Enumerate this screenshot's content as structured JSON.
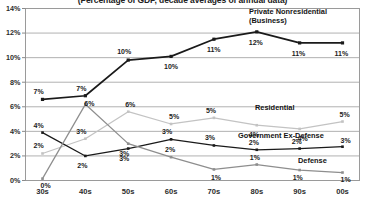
{
  "chart_data": {
    "type": "line",
    "title": "(Percentage of GDP, decade averages of annual data)",
    "xlabel": "",
    "ylabel": "",
    "categories": [
      "30s",
      "40s",
      "50s",
      "60s",
      "70s",
      "80s",
      "90s",
      "00s"
    ],
    "ylim": [
      0,
      14
    ],
    "ytick_labels": [
      "0%",
      "2%",
      "4%",
      "6%",
      "8%",
      "10%",
      "12%",
      "14%"
    ],
    "ytick_values": [
      0,
      2,
      4,
      6,
      8,
      10,
      12,
      14
    ],
    "grid": true,
    "legend_position": "inline-right",
    "series": [
      {
        "name": "Private Nonresidential (Business)",
        "label_line1": "Private Nonresidential",
        "label_line2": "(Business)",
        "color": "#1a1a1a",
        "marker": "square",
        "values": [
          6.6,
          6.9,
          9.8,
          10.1,
          11.5,
          12.1,
          11.2,
          11.2
        ],
        "point_labels": [
          "7%",
          "7%",
          "10%",
          "10%",
          "11%",
          "12%",
          "11%",
          "11%"
        ]
      },
      {
        "name": "Residential",
        "label_line1": "Residential",
        "label_line2": "",
        "color": "#c3c3c3",
        "marker": "square",
        "values": [
          2.2,
          3.4,
          5.6,
          4.6,
          5.1,
          4.5,
          4.2,
          4.8
        ],
        "point_labels": [
          "2%",
          "3%",
          "6%",
          "5%",
          "5%",
          "4%",
          "4%",
          "5%"
        ]
      },
      {
        "name": "Government Ex-Defense",
        "label_line1": "Government Ex-Defense",
        "label_line2": "",
        "color": "#1a1a1a",
        "marker": "square",
        "values": [
          3.9,
          2.0,
          2.6,
          3.35,
          2.85,
          2.5,
          2.6,
          2.75
        ],
        "point_labels": [
          "4%",
          "2%",
          "3%",
          "3%",
          "3%",
          "2%",
          "2%",
          "3%"
        ]
      },
      {
        "name": "Defense",
        "label_line1": "Defense",
        "label_line2": "",
        "color": "#8e8e8e",
        "marker": "square",
        "values": [
          0.15,
          6.2,
          3.0,
          1.9,
          0.9,
          1.3,
          0.85,
          0.65
        ],
        "point_labels": [
          "0%",
          "6%",
          "3%",
          "2%",
          "1%",
          "1%",
          "1%",
          "1%"
        ]
      }
    ],
    "point_label_offsets": [
      [
        [
          -4,
          -11
        ],
        [
          -4,
          -11
        ],
        [
          -6,
          -12
        ],
        [
          -2,
          7
        ],
        [
          -2,
          7
        ],
        [
          -3,
          7
        ],
        [
          -3,
          7
        ],
        [
          -3,
          7
        ]
      ],
      [
        [
          -4,
          -11
        ],
        [
          -4,
          -11
        ],
        [
          2,
          -11
        ],
        [
          3,
          -11
        ],
        [
          -3,
          -11
        ],
        [
          -3,
          6
        ],
        [
          3,
          6
        ],
        [
          2,
          -11
        ]
      ],
      [
        [
          -4,
          -11
        ],
        [
          -3,
          6
        ],
        [
          -4,
          6
        ],
        [
          -4,
          -11
        ],
        [
          -4,
          -11
        ],
        [
          -3,
          -11
        ],
        [
          -3,
          -11
        ],
        [
          3,
          -10
        ]
      ],
      [
        [
          3,
          3
        ],
        [
          4,
          -4
        ],
        [
          -4,
          6
        ],
        [
          -1,
          -11
        ],
        [
          2,
          5
        ],
        [
          -2,
          -11
        ],
        [
          -2,
          4
        ],
        [
          3,
          3
        ]
      ]
    ],
    "series_label_positions": [
      {
        "x": 249,
        "y": 8
      },
      {
        "x": 255,
        "y": 104
      },
      {
        "x": 238,
        "y": 132
      },
      {
        "x": 298,
        "y": 157
      }
    ]
  }
}
